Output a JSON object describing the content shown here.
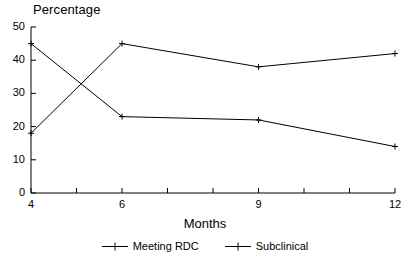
{
  "chart_data": {
    "type": "line",
    "title": "Percentage",
    "xlabel": "Months",
    "ylabel": "",
    "x": [
      4,
      6,
      9,
      12
    ],
    "xlim": [
      4,
      12
    ],
    "ylim": [
      0,
      50
    ],
    "yticks": [
      0,
      10,
      20,
      30,
      40,
      50
    ],
    "ytick_labels": [
      "0",
      "10",
      "20",
      "30",
      "40",
      "50"
    ],
    "xticks": [
      4,
      6,
      9,
      12
    ],
    "xtick_labels": [
      "4",
      "6",
      "9",
      "12"
    ],
    "x_minor_ticks": [
      5,
      7,
      8,
      10,
      11
    ],
    "grid": false,
    "legend_position": "below",
    "series": [
      {
        "name": "Meeting RDC",
        "values": [
          45,
          23,
          22,
          14
        ],
        "color": "#000000",
        "marker": "plus"
      },
      {
        "name": "Subclinical",
        "values": [
          18,
          45,
          38,
          42
        ],
        "color": "#000000",
        "marker": "plus"
      }
    ]
  },
  "legend": {
    "items": [
      {
        "label": "Meeting RDC"
      },
      {
        "label": "Subclinical"
      }
    ]
  }
}
